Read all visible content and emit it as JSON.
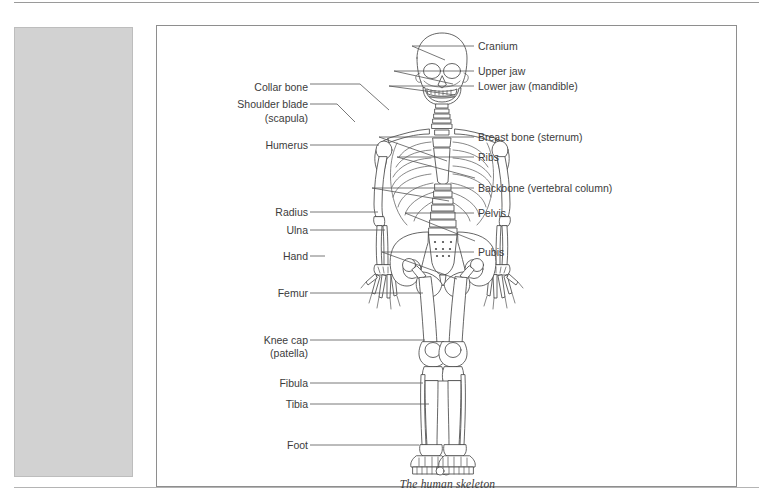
{
  "page": {
    "background_color": "#ffffff",
    "rule_color": "#9a9a9a"
  },
  "grey_panel": {
    "name": "image-placeholder-block",
    "fill_color": "#d2d2d2",
    "border_color": "#bdbdbd"
  },
  "figure": {
    "caption": "The human skeleton",
    "border_color": "#8e8e8e",
    "line_color": "#555555",
    "label_color": "#3c3c3c",
    "bone_outline_color": "#4a4a4a",
    "labels_left": [
      {
        "text": "Collar bone",
        "text_x": 149,
        "text_y": 61,
        "leader_x1": 153,
        "leader_y1": 58,
        "leader_x2": 203,
        "leader_y2": 58,
        "anchor_x": 232,
        "anchor_y": 84
      },
      {
        "text": "Shoulder blade",
        "text_x": 149,
        "text_y": 81,
        "leader_x1": 153,
        "leader_y1": 78,
        "leader_x2": 180,
        "leader_y2": 78,
        "anchor_x": 196,
        "anchor_y": 94
      },
      {
        "text": "(scapula)",
        "text_x": 149,
        "text_y": 95,
        "leader_x1": null,
        "leader_y1": null,
        "leader_x2": null,
        "leader_y2": null,
        "anchor_x": null,
        "anchor_y": null
      },
      {
        "text": "Humerus",
        "text_x": 149,
        "text_y": 122,
        "leader_x1": 153,
        "leader_y1": 119,
        "leader_x2": 196,
        "leader_y2": 119,
        "anchor_x": 196,
        "anchor_y": 119
      },
      {
        "text": "Radius",
        "text_x": 149,
        "text_y": 189,
        "leader_x1": 153,
        "leader_y1": 186,
        "leader_x2": 192,
        "leader_y2": 186,
        "anchor_x": 192,
        "anchor_y": 186
      },
      {
        "text": "Ulna",
        "text_x": 149,
        "text_y": 207,
        "leader_x1": 153,
        "leader_y1": 204,
        "leader_x2": 190,
        "leader_y2": 204,
        "anchor_x": 190,
        "anchor_y": 204
      },
      {
        "text": "Hand",
        "text_x": 149,
        "text_y": 233,
        "leader_x1": 153,
        "leader_y1": 230,
        "leader_x2": 168,
        "leader_y2": 230,
        "anchor_x": 168,
        "anchor_y": 230
      },
      {
        "text": "Femur",
        "text_x": 149,
        "text_y": 270,
        "leader_x1": 153,
        "leader_y1": 267,
        "leader_x2": 228,
        "leader_y2": 267,
        "anchor_x": 228,
        "anchor_y": 267
      },
      {
        "text": "Knee cap",
        "text_x": 149,
        "text_y": 317,
        "leader_x1": 153,
        "leader_y1": 314,
        "leader_x2": 220,
        "leader_y2": 314,
        "anchor_x": 220,
        "anchor_y": 314
      },
      {
        "text": "(patella)",
        "text_x": 149,
        "text_y": 330,
        "leader_x1": null,
        "leader_y1": null,
        "leader_x2": null,
        "leader_y2": null,
        "anchor_x": null,
        "anchor_y": null
      },
      {
        "text": "Fibula",
        "text_x": 149,
        "text_y": 360,
        "leader_x1": 153,
        "leader_y1": 357,
        "leader_x2": 222,
        "leader_y2": 357,
        "anchor_x": 222,
        "anchor_y": 357
      },
      {
        "text": "Tibia",
        "text_x": 149,
        "text_y": 381,
        "leader_x1": 153,
        "leader_y1": 378,
        "leader_x2": 226,
        "leader_y2": 378,
        "anchor_x": 226,
        "anchor_y": 378
      },
      {
        "text": "Foot",
        "text_x": 149,
        "text_y": 422,
        "leader_x1": 153,
        "leader_y1": 419,
        "leader_x2": 218,
        "leader_y2": 419,
        "anchor_x": 218,
        "anchor_y": 419
      }
    ],
    "labels_right": [
      {
        "text": "Cranium",
        "text_x": 321,
        "text_y": 23,
        "leader_x1": 255,
        "leader_y1": 20,
        "leader_x2": 317,
        "leader_y2": 20
      },
      {
        "text": "Upper jaw",
        "text_x": 321,
        "text_y": 48,
        "leader_x1": 237,
        "leader_y1": 45,
        "leader_x2": 317,
        "leader_y2": 45
      },
      {
        "text": "Lower jaw (mandible)",
        "text_x": 321,
        "text_y": 63,
        "leader_x1": 232,
        "leader_y1": 60,
        "leader_x2": 317,
        "leader_y2": 60
      },
      {
        "text": "Breast bone (sternum)",
        "text_x": 321,
        "text_y": 114,
        "leader_x1": 222,
        "leader_y1": 111,
        "leader_x2": 317,
        "leader_y2": 111
      },
      {
        "text": "Ribs",
        "text_x": 321,
        "text_y": 134,
        "leader_x1": 240,
        "leader_y1": 131,
        "leader_x2": 317,
        "leader_y2": 131
      },
      {
        "text": "Backbone (vertebral column)",
        "text_x": 321,
        "text_y": 165,
        "leader_x1": 215,
        "leader_y1": 162,
        "leader_x2": 317,
        "leader_y2": 162
      },
      {
        "text": "Pelvis",
        "text_x": 321,
        "text_y": 190,
        "leader_x1": 248,
        "leader_y1": 187,
        "leader_x2": 317,
        "leader_y2": 187
      },
      {
        "text": "Pubis",
        "text_x": 321,
        "text_y": 229,
        "leader_x1": 225,
        "leader_y1": 226,
        "leader_x2": 317,
        "leader_y2": 226
      }
    ]
  }
}
